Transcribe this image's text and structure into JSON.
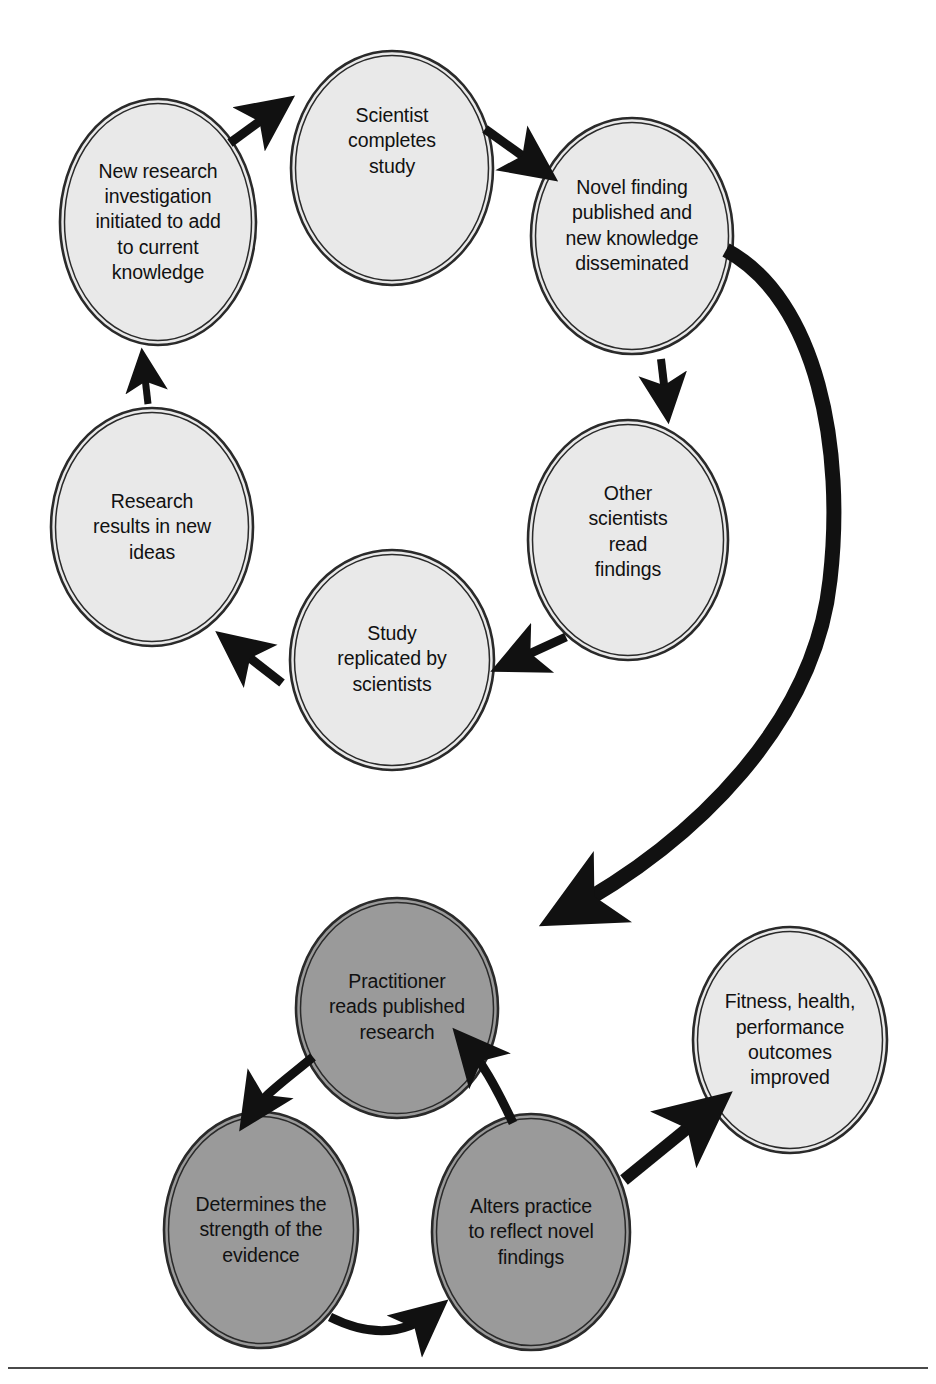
{
  "diagram": {
    "type": "cyclic-flow-diagram",
    "colors": {
      "light_node_fill": "#e9e9e9",
      "dark_node_fill": "#9a9a9a",
      "node_stroke": "#2a2a2a",
      "arrow": "#111111",
      "background": "#ffffff",
      "text": "#111111",
      "footer_rule": "#4a4a4a"
    },
    "clusters": [
      {
        "name": "research-cycle",
        "fill": "light",
        "nodes": [
          {
            "id": "new-research-investigation",
            "label": "New research\ninvestigation\ninitiated to add\nto current\nknowledge",
            "cx": 158,
            "cy": 222,
            "rx": 98,
            "ry": 123
          },
          {
            "id": "scientist-completes-study",
            "label": "Scientist\ncompletes\nstudy",
            "cx": 392,
            "cy": 168,
            "rx": 101,
            "ry": 117
          },
          {
            "id": "novel-finding-published",
            "label": "Novel finding\npublished and\nnew knowledge\ndisseminated",
            "cx": 632,
            "cy": 236,
            "rx": 101,
            "ry": 118
          },
          {
            "id": "other-scientists-read-findings",
            "label": "Other\nscientists\nread\nfindings",
            "cx": 628,
            "cy": 540,
            "rx": 100,
            "ry": 120
          },
          {
            "id": "study-replicated-by-scientists",
            "label": "Study\nreplicated by\nscientists",
            "cx": 392,
            "cy": 660,
            "rx": 102,
            "ry": 110
          },
          {
            "id": "research-results-in-new-ideas",
            "label": "Research\nresults in new\nideas",
            "cx": 152,
            "cy": 527,
            "rx": 101,
            "ry": 119
          }
        ]
      },
      {
        "name": "practice-cycle",
        "fill": "dark",
        "nodes": [
          {
            "id": "practitioner-reads-published-research",
            "label": "Practitioner\nreads published\nresearch",
            "cx": 397,
            "cy": 1008,
            "rx": 101,
            "ry": 110
          },
          {
            "id": "determines-strength-of-evidence",
            "label": "Determines the\nstrength of the\nevidence",
            "cx": 261,
            "cy": 1230,
            "rx": 97,
            "ry": 118
          },
          {
            "id": "alters-practice-to-reflect-novel-findings",
            "label": "Alters practice\nto reflect novel\nfindings",
            "cx": 531,
            "cy": 1232,
            "rx": 99,
            "ry": 118
          }
        ]
      },
      {
        "name": "outcome",
        "fill": "light",
        "nodes": [
          {
            "id": "fitness-health-performance-outcomes-improved",
            "label": "Fitness, health,\nperformance\noutcomes\nimproved",
            "cx": 790,
            "cy": 1040,
            "rx": 97,
            "ry": 113
          }
        ]
      }
    ],
    "edges": [
      {
        "id": "edge-ideas-to-new-research",
        "from": "research-results-in-new-ideas",
        "to": "new-research-investigation",
        "style": "straight"
      },
      {
        "id": "edge-new-research-to-scientist",
        "from": "new-research-investigation",
        "to": "scientist-completes-study",
        "style": "straight"
      },
      {
        "id": "edge-scientist-to-novel-finding",
        "from": "scientist-completes-study",
        "to": "novel-finding-published",
        "style": "straight"
      },
      {
        "id": "edge-novel-finding-to-other-scientists",
        "from": "novel-finding-published",
        "to": "other-scientists-read-findings",
        "style": "straight"
      },
      {
        "id": "edge-other-scientists-to-study-replicated",
        "from": "other-scientists-read-findings",
        "to": "study-replicated-by-scientists",
        "style": "straight"
      },
      {
        "id": "edge-study-replicated-to-ideas",
        "from": "study-replicated-by-scientists",
        "to": "research-results-in-new-ideas",
        "style": "straight"
      },
      {
        "id": "edge-novel-finding-to-practitioner",
        "from": "novel-finding-published",
        "to": "practitioner-reads-published-research",
        "style": "long-curve"
      },
      {
        "id": "edge-practitioner-to-determines",
        "from": "practitioner-reads-published-research",
        "to": "determines-strength-of-evidence",
        "style": "curve"
      },
      {
        "id": "edge-determines-to-alters",
        "from": "determines-strength-of-evidence",
        "to": "alters-practice-to-reflect-novel-findings",
        "style": "curve"
      },
      {
        "id": "edge-alters-to-practitioner",
        "from": "alters-practice-to-reflect-novel-findings",
        "to": "practitioner-reads-published-research",
        "style": "curve"
      },
      {
        "id": "edge-alters-to-outcomes",
        "from": "alters-practice-to-reflect-novel-findings",
        "to": "fitness-health-performance-outcomes-improved",
        "style": "straight"
      }
    ]
  }
}
